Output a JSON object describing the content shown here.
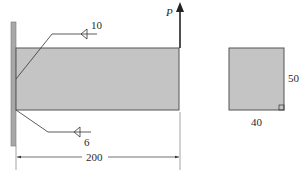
{
  "diagram": {
    "type": "welded cantilever beam with fillet welds",
    "beam": {
      "length_label": "200",
      "fill": "#c4c4c4",
      "stroke": "#555555"
    },
    "wall": {
      "fill": "#a8a8a8"
    },
    "load": {
      "label": "P",
      "direction": "up"
    },
    "welds": [
      {
        "size_label": "10",
        "position": "top"
      },
      {
        "size_label": "6",
        "position": "bottom"
      }
    ],
    "cross_section": {
      "width_label": "40",
      "height_label": "50",
      "fill": "#c4c4c4"
    }
  }
}
